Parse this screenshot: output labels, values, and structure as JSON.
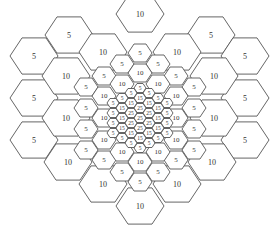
{
  "diagram": {
    "type": "hexagonal-cell-grid",
    "stroke_color": "#555555",
    "text_color": "#333333",
    "cells": [
      {
        "x": 34,
        "y": 56,
        "r": 24,
        "label": "5"
      },
      {
        "x": 34,
        "y": 98,
        "r": 24,
        "label": "5"
      },
      {
        "x": 34,
        "y": 140,
        "r": 24,
        "label": "5"
      },
      {
        "x": 69,
        "y": 35,
        "r": 24,
        "label": "5"
      },
      {
        "x": 140,
        "y": 14,
        "r": 24,
        "label": "10"
      },
      {
        "x": 211,
        "y": 35,
        "r": 24,
        "label": "5"
      },
      {
        "x": 245,
        "y": 56,
        "r": 24,
        "label": "5"
      },
      {
        "x": 245,
        "y": 98,
        "r": 24,
        "label": "5"
      },
      {
        "x": 245,
        "y": 140,
        "r": 24,
        "label": "5"
      },
      {
        "x": 103,
        "y": 52,
        "r": 24,
        "label": "10"
      },
      {
        "x": 177,
        "y": 52,
        "r": 24,
        "label": "10"
      },
      {
        "x": 66,
        "y": 76,
        "r": 24,
        "label": "10"
      },
      {
        "x": 214,
        "y": 76,
        "r": 24,
        "label": "10"
      },
      {
        "x": 66,
        "y": 118,
        "r": 24,
        "label": "10"
      },
      {
        "x": 214,
        "y": 118,
        "r": 24,
        "label": "10"
      },
      {
        "x": 68,
        "y": 162,
        "r": 24,
        "label": "10"
      },
      {
        "x": 212,
        "y": 162,
        "r": 24,
        "label": "10"
      },
      {
        "x": 103,
        "y": 184,
        "r": 24,
        "label": "10"
      },
      {
        "x": 177,
        "y": 184,
        "r": 24,
        "label": "10"
      },
      {
        "x": 140,
        "y": 206,
        "r": 24,
        "label": "10"
      },
      {
        "x": 140,
        "y": 53,
        "r": 12,
        "label": "5"
      },
      {
        "x": 122,
        "y": 64,
        "r": 12,
        "label": "5"
      },
      {
        "x": 158,
        "y": 64,
        "r": 12,
        "label": "5"
      },
      {
        "x": 104,
        "y": 76,
        "r": 12,
        "label": "5"
      },
      {
        "x": 176,
        "y": 76,
        "r": 12,
        "label": "5"
      },
      {
        "x": 86,
        "y": 87,
        "r": 12,
        "label": "5"
      },
      {
        "x": 194,
        "y": 87,
        "r": 12,
        "label": "5"
      },
      {
        "x": 86,
        "y": 108,
        "r": 12,
        "label": "5"
      },
      {
        "x": 194,
        "y": 108,
        "r": 12,
        "label": "5"
      },
      {
        "x": 86,
        "y": 129,
        "r": 12,
        "label": "5"
      },
      {
        "x": 194,
        "y": 129,
        "r": 12,
        "label": "5"
      },
      {
        "x": 86,
        "y": 150,
        "r": 12,
        "label": "5"
      },
      {
        "x": 194,
        "y": 150,
        "r": 12,
        "label": "5"
      },
      {
        "x": 104,
        "y": 160,
        "r": 12,
        "label": "5"
      },
      {
        "x": 176,
        "y": 160,
        "r": 12,
        "label": "5"
      },
      {
        "x": 122,
        "y": 172,
        "r": 12,
        "label": "5"
      },
      {
        "x": 158,
        "y": 172,
        "r": 12,
        "label": "5"
      },
      {
        "x": 140,
        "y": 182,
        "r": 12,
        "label": "5"
      },
      {
        "x": 140,
        "y": 73,
        "r": 12,
        "label": "10"
      },
      {
        "x": 122,
        "y": 84,
        "r": 12,
        "label": "10"
      },
      {
        "x": 158,
        "y": 84,
        "r": 12,
        "label": "10"
      },
      {
        "x": 104,
        "y": 96,
        "r": 12,
        "label": "10"
      },
      {
        "x": 176,
        "y": 96,
        "r": 12,
        "label": "10"
      },
      {
        "x": 104,
        "y": 118,
        "r": 12,
        "label": "10"
      },
      {
        "x": 176,
        "y": 118,
        "r": 12,
        "label": "10"
      },
      {
        "x": 104,
        "y": 140,
        "r": 12,
        "label": "10"
      },
      {
        "x": 176,
        "y": 140,
        "r": 12,
        "label": "10"
      },
      {
        "x": 122,
        "y": 152,
        "r": 12,
        "label": "10"
      },
      {
        "x": 158,
        "y": 152,
        "r": 12,
        "label": "10"
      },
      {
        "x": 140,
        "y": 162,
        "r": 12,
        "label": "10"
      },
      {
        "x": 140,
        "y": 88,
        "r": 6,
        "label": "5"
      },
      {
        "x": 131,
        "y": 93,
        "r": 6,
        "label": "5"
      },
      {
        "x": 149,
        "y": 93,
        "r": 6,
        "label": "5"
      },
      {
        "x": 122,
        "y": 98,
        "r": 6,
        "label": "5"
      },
      {
        "x": 158,
        "y": 98,
        "r": 6,
        "label": "5"
      },
      {
        "x": 113,
        "y": 103,
        "r": 6,
        "label": "5"
      },
      {
        "x": 167,
        "y": 103,
        "r": 6,
        "label": "5"
      },
      {
        "x": 113,
        "y": 113,
        "r": 6,
        "label": "5"
      },
      {
        "x": 167,
        "y": 113,
        "r": 6,
        "label": "5"
      },
      {
        "x": 113,
        "y": 123,
        "r": 6,
        "label": "5"
      },
      {
        "x": 167,
        "y": 123,
        "r": 6,
        "label": "5"
      },
      {
        "x": 113,
        "y": 133,
        "r": 6,
        "label": "5"
      },
      {
        "x": 167,
        "y": 133,
        "r": 6,
        "label": "5"
      },
      {
        "x": 122,
        "y": 138,
        "r": 6,
        "label": "5"
      },
      {
        "x": 158,
        "y": 138,
        "r": 6,
        "label": "5"
      },
      {
        "x": 131,
        "y": 143,
        "r": 6,
        "label": "5"
      },
      {
        "x": 149,
        "y": 143,
        "r": 6,
        "label": "5"
      },
      {
        "x": 140,
        "y": 148,
        "r": 6,
        "label": "5"
      },
      {
        "x": 140,
        "y": 98,
        "r": 6,
        "label": "15"
      },
      {
        "x": 131,
        "y": 103,
        "r": 6,
        "label": "15"
      },
      {
        "x": 149,
        "y": 103,
        "r": 6,
        "label": "15"
      },
      {
        "x": 122,
        "y": 108,
        "r": 6,
        "label": "15"
      },
      {
        "x": 158,
        "y": 108,
        "r": 6,
        "label": "15"
      },
      {
        "x": 122,
        "y": 118,
        "r": 6,
        "label": "15"
      },
      {
        "x": 158,
        "y": 118,
        "r": 6,
        "label": "15"
      },
      {
        "x": 122,
        "y": 128,
        "r": 6,
        "label": "15"
      },
      {
        "x": 158,
        "y": 128,
        "r": 6,
        "label": "15"
      },
      {
        "x": 131,
        "y": 133,
        "r": 6,
        "label": "15"
      },
      {
        "x": 149,
        "y": 133,
        "r": 6,
        "label": "15"
      },
      {
        "x": 140,
        "y": 138,
        "r": 6,
        "label": "15"
      },
      {
        "x": 140,
        "y": 108,
        "r": 6,
        "label": "25"
      },
      {
        "x": 131,
        "y": 113,
        "r": 6,
        "label": "25"
      },
      {
        "x": 149,
        "y": 113,
        "r": 6,
        "label": "25"
      },
      {
        "x": 131,
        "y": 123,
        "r": 6,
        "label": "25"
      },
      {
        "x": 149,
        "y": 123,
        "r": 6,
        "label": "25"
      },
      {
        "x": 140,
        "y": 128,
        "r": 6,
        "label": "25"
      },
      {
        "x": 140,
        "y": 118,
        "r": 6,
        "label": "25"
      }
    ]
  }
}
